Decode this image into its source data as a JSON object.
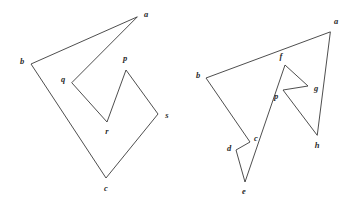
{
  "figure": {
    "background_color": "#ffffff",
    "stroke_color": "#3a3a3a",
    "label_color": "#2b2b2b",
    "canvas": {
      "width": 352,
      "height": 202
    }
  },
  "left_polygon": {
    "name": "left-polygon",
    "closed": true,
    "vertex_order": [
      "a",
      "b",
      "c",
      "s",
      "p",
      "r",
      "q"
    ],
    "vertices": [
      {
        "id": "a",
        "label": "a",
        "x": 137,
        "y": 17,
        "label_x": 146,
        "label_y": 15
      },
      {
        "id": "b",
        "label": "b",
        "x": 31,
        "y": 64,
        "label_x": 22,
        "label_y": 62
      },
      {
        "id": "c",
        "label": "c",
        "x": 106,
        "y": 178,
        "label_x": 106,
        "label_y": 189
      },
      {
        "id": "s",
        "label": "s",
        "x": 158,
        "y": 114,
        "label_x": 167,
        "label_y": 116
      },
      {
        "id": "p",
        "label": "p",
        "x": 126,
        "y": 70,
        "label_x": 125,
        "label_y": 59
      },
      {
        "id": "r",
        "label": "r",
        "x": 107,
        "y": 122,
        "label_x": 107,
        "label_y": 132
      },
      {
        "id": "q",
        "label": "q",
        "x": 72,
        "y": 83,
        "label_x": 63,
        "label_y": 80
      }
    ]
  },
  "right_polygon": {
    "name": "right-polygon",
    "closed": true,
    "vertex_order": [
      "a",
      "b",
      "c",
      "d",
      "e",
      "f",
      "g",
      "p",
      "h"
    ],
    "vertices": [
      {
        "id": "a",
        "label": "a",
        "x": 330,
        "y": 32,
        "label_x": 336,
        "label_y": 22
      },
      {
        "id": "b",
        "label": "b",
        "x": 206,
        "y": 78,
        "label_x": 198,
        "label_y": 76
      },
      {
        "id": "c",
        "label": "c",
        "x": 250,
        "y": 142,
        "label_x": 256,
        "label_y": 139
      },
      {
        "id": "d",
        "label": "d",
        "x": 236,
        "y": 150,
        "label_x": 229,
        "label_y": 149
      },
      {
        "id": "e",
        "label": "e",
        "x": 245,
        "y": 182,
        "label_x": 244,
        "label_y": 192
      },
      {
        "id": "f",
        "label": "f",
        "x": 285,
        "y": 65,
        "label_x": 281,
        "label_y": 57
      },
      {
        "id": "g",
        "label": "g",
        "x": 308,
        "y": 86,
        "label_x": 316,
        "label_y": 89
      },
      {
        "id": "p",
        "label": "p",
        "x": 283,
        "y": 90,
        "label_x": 276,
        "label_y": 97
      },
      {
        "id": "h",
        "label": "h",
        "x": 317,
        "y": 135,
        "label_x": 317,
        "label_y": 146
      }
    ]
  }
}
